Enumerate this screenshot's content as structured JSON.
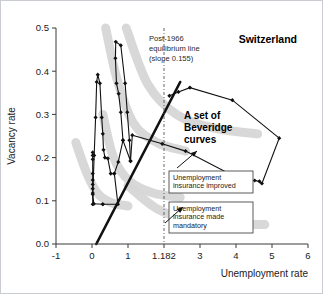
{
  "figure": {
    "country_label": "Switzerland",
    "center_annotation": [
      "A set of",
      "Beveridge",
      "curves"
    ],
    "equilibrium_note": [
      "Post-1966",
      "equilibrium line",
      "(slope 0.155)"
    ],
    "callouts": [
      {
        "name": "unemployment-insurance-improved",
        "lines": [
          "Unemployment",
          "insurance improved"
        ]
      },
      {
        "name": "unemployment-insurance-mandatory",
        "lines": [
          "Unemployment",
          "insurance made",
          "mandatory"
        ]
      }
    ],
    "colors": {
      "band": "#d6d6d6",
      "curve": "#111111",
      "frame": "#c9ccd1",
      "background": "#ffffff"
    }
  },
  "chart_data": {
    "type": "line",
    "title": "Switzerland",
    "xlabel": "Unemployment rate",
    "ylabel": "Vacancy rate",
    "xlim": [
      -1,
      6
    ],
    "ylim": [
      0.0,
      0.5
    ],
    "xticks": [
      -1,
      0,
      1,
      2,
      3,
      4,
      5,
      6
    ],
    "xticklabels": [
      "-1",
      "0",
      "1",
      "1.182",
      "3",
      "4",
      "5",
      "6"
    ],
    "yticks": [
      0.0,
      0.1,
      0.2,
      0.3,
      0.4,
      0.5
    ],
    "yticklabels": [
      "0.0",
      "0.1",
      "0.2",
      "0.3",
      "0.4",
      "0.5"
    ],
    "grid": false,
    "legend": "none",
    "reference_lines": [
      {
        "name": "post-1966-equilibrium-line",
        "type": "ray",
        "slope": 0.155,
        "x0": 0.12,
        "y0": 0.0,
        "x1": 2.45,
        "y1": 0.375
      },
      {
        "name": "threshold-vline",
        "type": "vertical",
        "x": 2.0,
        "label": "1.182"
      }
    ],
    "series": [
      {
        "name": "inner-loop-early",
        "points": [
          [
            0.3,
            0.092
          ],
          [
            0.05,
            0.093
          ],
          [
            0.02,
            0.115
          ],
          [
            0.06,
            0.205
          ],
          [
            0.1,
            0.293
          ],
          [
            0.13,
            0.375
          ],
          [
            0.16,
            0.392
          ],
          [
            0.22,
            0.372
          ],
          [
            0.27,
            0.293
          ],
          [
            0.3,
            0.255
          ],
          [
            0.32,
            0.218
          ],
          [
            0.36,
            0.2
          ],
          [
            0.44,
            0.198
          ],
          [
            0.52,
            0.163
          ],
          [
            0.62,
            0.163
          ],
          [
            0.72,
            0.092
          ],
          [
            0.3,
            0.092
          ]
        ]
      },
      {
        "name": "mid-loop",
        "points": [
          [
            0.62,
            0.163
          ],
          [
            0.73,
            0.19
          ],
          [
            0.86,
            0.24
          ],
          [
            0.8,
            0.305
          ],
          [
            0.74,
            0.348
          ],
          [
            0.68,
            0.372
          ],
          [
            0.65,
            0.43
          ],
          [
            0.66,
            0.468
          ],
          [
            0.8,
            0.46
          ],
          [
            0.92,
            0.372
          ],
          [
            0.98,
            0.305
          ],
          [
            1.04,
            0.24
          ],
          [
            1.07,
            0.192
          ],
          [
            0.86,
            0.24
          ]
        ]
      },
      {
        "name": "vertical-cluster",
        "points": [
          [
            0.02,
            0.092
          ],
          [
            0.02,
            0.118
          ],
          [
            0.02,
            0.128
          ],
          [
            0.02,
            0.138
          ],
          [
            0.02,
            0.148
          ],
          [
            0.02,
            0.163
          ],
          [
            0.02,
            0.196
          ],
          [
            0.02,
            0.205
          ],
          [
            0.02,
            0.212
          ]
        ]
      },
      {
        "name": "outer-loop-late",
        "points": [
          [
            1.07,
            0.192
          ],
          [
            1.12,
            0.252
          ],
          [
            1.95,
            0.232
          ],
          [
            2.6,
            0.215
          ],
          [
            4.15,
            0.148
          ],
          [
            4.52,
            0.147
          ],
          [
            4.65,
            0.145
          ],
          [
            4.72,
            0.14
          ],
          [
            5.2,
            0.245
          ],
          [
            3.9,
            0.333
          ],
          [
            2.72,
            0.362
          ],
          [
            2.4,
            0.352
          ],
          [
            2.15,
            0.343
          ]
        ]
      }
    ],
    "bands": [
      {
        "name": "beveridge-band-1",
        "points": [
          [
            0.38,
            0.5
          ],
          [
            0.7,
            0.38
          ],
          [
            1.15,
            0.28
          ],
          [
            1.8,
            0.235
          ],
          [
            2.6,
            0.215
          ]
        ]
      },
      {
        "name": "beveridge-band-2",
        "points": [
          [
            0.95,
            0.5
          ],
          [
            1.55,
            0.37
          ],
          [
            2.35,
            0.3
          ],
          [
            3.4,
            0.268
          ],
          [
            4.6,
            0.255
          ]
        ]
      },
      {
        "name": "beveridge-band-3",
        "points": [
          [
            -0.45,
            0.235
          ],
          [
            -0.15,
            0.165
          ],
          [
            0.15,
            0.118
          ],
          [
            0.55,
            0.095
          ],
          [
            1.0,
            0.088
          ]
        ]
      },
      {
        "name": "beveridge-band-4",
        "points": [
          [
            0.3,
            0.3
          ],
          [
            0.6,
            0.2
          ],
          [
            1.05,
            0.145
          ],
          [
            1.7,
            0.118
          ],
          [
            2.45,
            0.108
          ]
        ]
      },
      {
        "name": "beveridge-band-5",
        "points": [
          [
            1.0,
            0.135
          ],
          [
            1.8,
            0.082
          ],
          [
            2.7,
            0.055
          ],
          [
            3.7,
            0.047
          ],
          [
            4.8,
            0.045
          ]
        ]
      }
    ]
  }
}
